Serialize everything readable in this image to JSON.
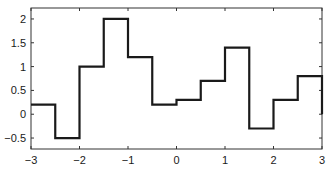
{
  "chart_data": {
    "type": "line",
    "style": "step",
    "title": "",
    "xlabel": "",
    "ylabel": "",
    "xlim": [
      -3,
      3
    ],
    "ylim": [
      -0.73,
      2.23
    ],
    "grid": false,
    "legend": null,
    "x_ticks": [
      -3,
      -2,
      -1,
      0,
      1,
      2,
      3
    ],
    "x_tick_labels": [
      "−3",
      "−2",
      "−1",
      "0",
      "1",
      "2",
      "3"
    ],
    "y_ticks": [
      -0.5,
      0,
      0.5,
      1,
      1.5,
      2
    ],
    "y_tick_labels": [
      "−0.5",
      "0",
      "0.5",
      "1",
      "1.5",
      "2"
    ],
    "series": [
      {
        "name": "step function",
        "color": "#1a1a1a",
        "bin_edges": [
          -3,
          -2.5,
          -2,
          -1.5,
          -1,
          -0.5,
          0,
          0.5,
          1,
          1.5,
          2,
          2.5,
          3
        ],
        "values": [
          0.2,
          -0.5,
          1.0,
          2.0,
          1.2,
          0.2,
          0.3,
          0.7,
          1.4,
          -0.3,
          0.3,
          0.8
        ],
        "end_value": 0.0
      }
    ]
  }
}
